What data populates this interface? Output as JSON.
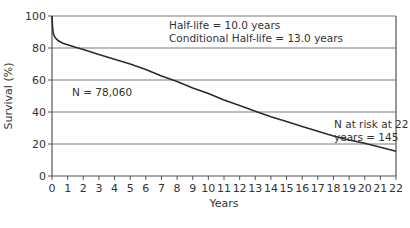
{
  "chart_data": {
    "type": "line",
    "title": "",
    "xlabel": "Years",
    "ylabel": "Survival (%)",
    "xlim": [
      0,
      22
    ],
    "ylim": [
      0,
      100
    ],
    "x_ticks": [
      0,
      1,
      2,
      3,
      4,
      5,
      6,
      7,
      8,
      9,
      10,
      11,
      12,
      13,
      14,
      15,
      16,
      17,
      18,
      19,
      20,
      21,
      22
    ],
    "y_ticks": [
      0,
      20,
      40,
      60,
      80,
      100
    ],
    "grid": {
      "horizontal": true,
      "vertical": false
    },
    "series": [
      {
        "name": "Survival",
        "x": [
          0,
          0.03,
          0.08,
          0.2,
          0.4,
          0.7,
          1,
          1.5,
          2,
          3,
          4,
          5,
          6,
          7,
          8,
          9,
          10,
          11,
          12,
          13,
          14,
          15,
          16,
          17,
          18,
          19,
          20,
          21,
          22
        ],
        "values": [
          100,
          93,
          89,
          86.5,
          84.5,
          83,
          82,
          80.5,
          79,
          76,
          73,
          70,
          66.5,
          62.5,
          59,
          55,
          51.5,
          47.5,
          44,
          40.5,
          37,
          34,
          31,
          28,
          25,
          22.5,
          20.5,
          18,
          15.5
        ]
      }
    ],
    "annotations": [
      {
        "text": "Half-life = 10.0 years",
        "x": 7.5,
        "y": 94
      },
      {
        "text": "Conditional Half-life = 13.0 years",
        "x": 7.5,
        "y": 86.5
      },
      {
        "text": "N = 78,060",
        "x": 1.3,
        "y": 52
      },
      {
        "text": "N at risk at 22",
        "x": 18,
        "y": 32
      },
      {
        "text": "years = 145",
        "x": 18.4,
        "y": 24
      }
    ]
  },
  "labels": {
    "xlabel": "Years",
    "ylabel": "Survival (%)",
    "half_life": "Half-life = 10.0 years",
    "conditional_half_life": "Conditional Half-life = 13.0 years",
    "n_total": "N = 78,060",
    "n_at_risk_line1": "N at risk at 22",
    "n_at_risk_line2": "years = 145"
  },
  "colors": {
    "line": "#2b2b2b",
    "grid": "#7a7a7a",
    "axis": "#555555",
    "text": "#333333"
  }
}
